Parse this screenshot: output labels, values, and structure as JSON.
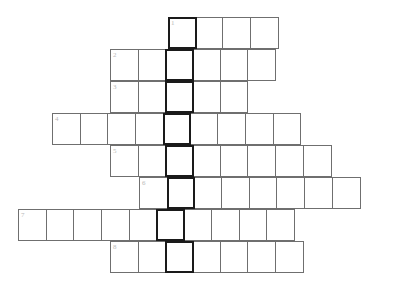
{
  "puzzle": {
    "title": "Crossword Puzzle Grid",
    "type": "crossword",
    "cell_width": 28.7,
    "cell_height": 32,
    "grid_origin_x": 18,
    "grid_origin_y": 17,
    "colors": {
      "background": "#ffffff",
      "cell_fill": "#ffffff",
      "cell_border": "#6f6f6f",
      "highlight_border": "#1a1a1a",
      "number_text": "#b9b9b9"
    },
    "highlight_column_index": 5,
    "rows": [
      {
        "id": "row-1",
        "number": "1",
        "start_col": 5,
        "length": 4,
        "offset_x": 168,
        "offset_y": 17,
        "highlight_index": 0,
        "cells": [
          "1",
          "",
          "",
          ""
        ]
      },
      {
        "id": "row-2",
        "number": "2",
        "start_col": 3,
        "length": 6,
        "offset_x": 110,
        "offset_y": 49,
        "highlight_index": 2,
        "cells": [
          "2",
          "",
          "",
          "",
          "",
          ""
        ]
      },
      {
        "id": "row-3",
        "number": "3",
        "start_col": 3,
        "length": 5,
        "offset_x": 110,
        "offset_y": 81,
        "highlight_index": 2,
        "cells": [
          "3",
          "",
          "",
          "",
          ""
        ]
      },
      {
        "id": "row-4",
        "number": "4",
        "start_col": 1,
        "length": 9,
        "offset_x": 52,
        "offset_y": 113,
        "highlight_index": 4,
        "cells": [
          "4",
          "",
          "",
          "",
          "",
          "",
          "",
          "",
          ""
        ]
      },
      {
        "id": "row-5",
        "number": "5",
        "start_col": 3,
        "length": 8,
        "offset_x": 110,
        "offset_y": 145,
        "highlight_index": 2,
        "cells": [
          "5",
          "",
          "",
          "",
          "",
          "",
          "",
          ""
        ]
      },
      {
        "id": "row-6",
        "number": "6",
        "start_col": 4,
        "length": 8,
        "offset_x": 139,
        "offset_y": 177,
        "highlight_index": 1,
        "cells": [
          "6",
          "",
          "",
          "",
          "",
          "",
          "",
          ""
        ]
      },
      {
        "id": "row-7",
        "number": "7",
        "start_col": 0,
        "length": 10,
        "offset_x": 18,
        "offset_y": 209,
        "highlight_index": 5,
        "cells": [
          "7",
          "",
          "",
          "",
          "",
          "",
          "",
          "",
          "",
          ""
        ]
      },
      {
        "id": "row-8",
        "number": "8",
        "start_col": 3,
        "length": 7,
        "offset_x": 110,
        "offset_y": 241,
        "highlight_index": 2,
        "cells": [
          "8",
          "",
          "",
          "",
          "",
          "",
          ""
        ]
      }
    ]
  }
}
